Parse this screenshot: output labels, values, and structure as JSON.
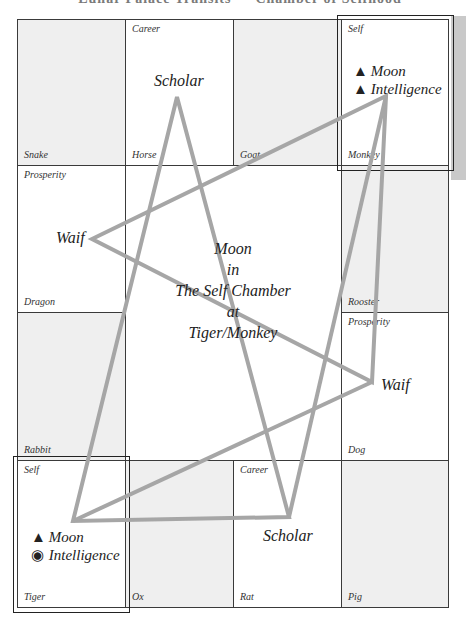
{
  "header": {
    "title": "Lunar Palace Transits — Chamber of Selfhood"
  },
  "grid": {
    "cells": [
      {
        "top": "",
        "bottom": "Snake"
      },
      {
        "top": "Career",
        "bottom": "Horse"
      },
      {
        "top": "",
        "bottom": "Goat"
      },
      {
        "top": "Self",
        "bottom": "Monkey"
      },
      {
        "top": "Prosperity",
        "bottom": "Dragon"
      },
      {
        "top": "",
        "bottom": "Rooster"
      },
      {
        "top": "",
        "bottom": "Rabbit"
      },
      {
        "top": "Prosperity",
        "bottom": "Dog"
      },
      {
        "top": "Self",
        "bottom": "Tiger"
      },
      {
        "top": "",
        "bottom": "Ox"
      },
      {
        "top": "Career",
        "bottom": "Rat"
      },
      {
        "top": "",
        "bottom": "Pig"
      }
    ]
  },
  "stars": {
    "scholar_top": "Scholar",
    "scholar_bottom": "Scholar",
    "waif_left": "Waif",
    "waif_right": "Waif"
  },
  "monkey_markers": [
    {
      "icon": "▲",
      "label": "Moon"
    },
    {
      "icon": "▲",
      "label": "Intelligence"
    }
  ],
  "tiger_markers": [
    {
      "icon": "▲",
      "label": "Moon"
    },
    {
      "icon": "◉",
      "label": "Intelligence"
    }
  ],
  "center": {
    "line1": "Moon",
    "line2": "in",
    "line3": "The Self Chamber",
    "line4": "at",
    "line5": "Tiger/Monkey"
  },
  "colors": {
    "star_line": "#a6a6a6",
    "grid_line": "#3a3a3a",
    "shade": "#efefef"
  }
}
